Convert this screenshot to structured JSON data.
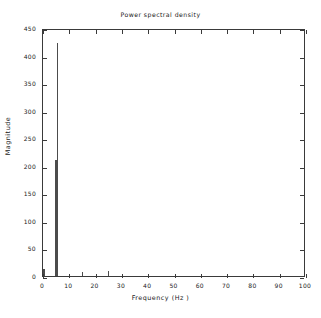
{
  "chart_data": {
    "type": "bar",
    "title": "Power spectral density",
    "xlabel": "Frequency (Hz )",
    "ylabel": "Magnitude",
    "xlim": [
      0,
      100
    ],
    "ylim": [
      0,
      450
    ],
    "grid": false,
    "legend": null,
    "xticks": [
      0,
      10,
      20,
      30,
      40,
      50,
      60,
      70,
      80,
      90,
      100
    ],
    "xticklabels": [
      "0",
      "10",
      "20",
      "30",
      "40",
      "50",
      "60",
      "70",
      "80",
      "90",
      "100"
    ],
    "yticks": [
      0,
      50,
      100,
      150,
      200,
      250,
      300,
      350,
      400,
      450
    ],
    "yticklabels": [
      "0",
      "50",
      "100",
      "150",
      "200",
      "250",
      "300",
      "350",
      "400",
      "450"
    ],
    "series": [
      {
        "name": "Power spectral density",
        "color": "#4c4c4c",
        "x": [
          0.3,
          5.0,
          5.6,
          15.0,
          25.0
        ],
        "values": [
          12,
          210,
          422,
          7,
          9
        ],
        "widths": [
          1.0,
          1.1,
          0.45,
          0.4,
          0.4
        ]
      }
    ],
    "peak": {
      "frequency": 5.6,
      "magnitude": 422
    },
    "secondary_peak": {
      "frequency": 5.0,
      "magnitude": 210
    }
  },
  "figure": {
    "background": "#ffffff",
    "axis_color": "#3a3a3a",
    "data_color": "#4c4c4c"
  }
}
